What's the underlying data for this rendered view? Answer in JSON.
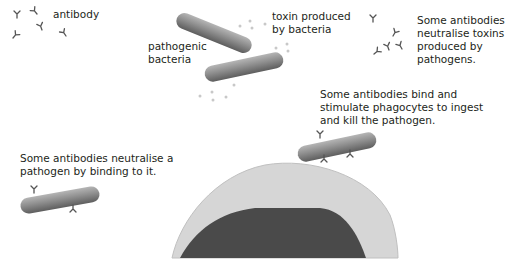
{
  "labels": {
    "antibody": "antibody",
    "pathogenic_bacteria": "pathogenic\nbacteria",
    "toxin": "toxin produced\nby bacteria",
    "neutralise_toxins": "Some antibodies\nneutralise toxins\nproduced by\npathogens.",
    "phagocytes": "Some antibodies bind and\nstimulate phagocytes to ingest\nand kill the pathogen.",
    "neutralise_pathogen": "Some antibodies neutralise a\npathogen by binding to it."
  },
  "colors": {
    "bacteria_light": "#a9a9a9",
    "bacteria_dark": "#6d6d6d",
    "antibody": "#555555",
    "toxin": "#c8c8c8",
    "phagocyte_cytoplasm": "#d6d6d6",
    "phagocyte_nucleus": "#4a4a4a",
    "text": "#231f20"
  }
}
